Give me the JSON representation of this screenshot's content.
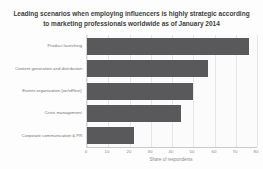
{
  "chart_data": {
    "type": "bar",
    "orientation": "horizontal",
    "title": "Leading scenarios when employing influencers is highly strategic according to marketing professionals worldwide as of January 2014",
    "categories": [
      "Product launching",
      "Content generation and distribution",
      "Events organization (on/offline)",
      "Crisis management",
      "Corporate communication & PR"
    ],
    "values": [
      76,
      57,
      50,
      44,
      22
    ],
    "xlabel": "Share of respondents",
    "xlim": [
      0,
      80
    ],
    "xticks": [
      0,
      10,
      20,
      30,
      40,
      50,
      60,
      70,
      80
    ],
    "grid": true,
    "legend": false,
    "colors": {
      "bar": "#59595b",
      "grid": "#e6e6e6",
      "axis": "#c9c9c9",
      "title_text": "#3d3d3d",
      "category_text": "#757575",
      "tick_text": "#8b8b8b",
      "plot_background": "#fbfbfb"
    }
  }
}
